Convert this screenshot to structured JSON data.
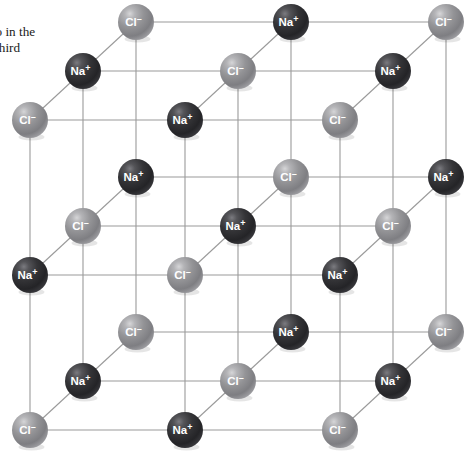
{
  "figure": {
    "caption_text": "wo in the\ne third\nhe",
    "background_color": "#ffffff"
  },
  "legend": {
    "sodium_label": "Na",
    "sodium_charge": "+",
    "chloride_label": "Cl",
    "chloride_charge": "–",
    "sodium_color": "#2f2f31",
    "sodium_highlight": "#6e6e72",
    "chloride_color": "#8d8d8f",
    "chloride_highlight": "#c9c9cb",
    "bond_color": "#9a9a9a",
    "grid_color": "#9a9a9a"
  },
  "lattice": {
    "type": "rock-salt",
    "dimensions": "3 x 3 x 3",
    "grid_spacing_x": 155,
    "grid_spacing_y": 155,
    "depth_offset_x": 53,
    "depth_offset_y": -49,
    "origin_x": 30,
    "origin_y": 430,
    "sphere_radius": 18,
    "ions": [
      {
        "i": 0,
        "j": 0,
        "k": 0,
        "x": 30,
        "y": 430,
        "species": "Cl",
        "charge": "–",
        "label": "Cl"
      },
      {
        "i": 1,
        "j": 0,
        "k": 0,
        "x": 185,
        "y": 430,
        "species": "Na",
        "charge": "+",
        "label": "Na"
      },
      {
        "i": 2,
        "j": 0,
        "k": 0,
        "x": 340,
        "y": 430,
        "species": "Cl",
        "charge": "–",
        "label": "Cl"
      },
      {
        "i": 0,
        "j": 1,
        "k": 0,
        "x": 30,
        "y": 275,
        "species": "Na",
        "charge": "+",
        "label": "Na"
      },
      {
        "i": 1,
        "j": 1,
        "k": 0,
        "x": 185,
        "y": 275,
        "species": "Cl",
        "charge": "–",
        "label": "Cl"
      },
      {
        "i": 2,
        "j": 1,
        "k": 0,
        "x": 340,
        "y": 275,
        "species": "Na",
        "charge": "+",
        "label": "Na"
      },
      {
        "i": 0,
        "j": 2,
        "k": 0,
        "x": 30,
        "y": 120,
        "species": "Cl",
        "charge": "–",
        "label": "Cl"
      },
      {
        "i": 1,
        "j": 2,
        "k": 0,
        "x": 185,
        "y": 120,
        "species": "Na",
        "charge": "+",
        "label": "Na"
      },
      {
        "i": 2,
        "j": 2,
        "k": 0,
        "x": 340,
        "y": 120,
        "species": "Cl",
        "charge": "–",
        "label": "Cl"
      },
      {
        "i": 0,
        "j": 0,
        "k": 1,
        "x": 83,
        "y": 381,
        "species": "Na",
        "charge": "+",
        "label": "Na"
      },
      {
        "i": 1,
        "j": 0,
        "k": 1,
        "x": 238,
        "y": 381,
        "species": "Cl",
        "charge": "–",
        "label": "Cl"
      },
      {
        "i": 2,
        "j": 0,
        "k": 1,
        "x": 393,
        "y": 381,
        "species": "Na",
        "charge": "+",
        "label": "Na"
      },
      {
        "i": 0,
        "j": 1,
        "k": 1,
        "x": 83,
        "y": 226,
        "species": "Cl",
        "charge": "–",
        "label": "Cl"
      },
      {
        "i": 1,
        "j": 1,
        "k": 1,
        "x": 238,
        "y": 226,
        "species": "Na",
        "charge": "+",
        "label": "Na"
      },
      {
        "i": 2,
        "j": 1,
        "k": 1,
        "x": 393,
        "y": 226,
        "species": "Cl",
        "charge": "–",
        "label": "Cl"
      },
      {
        "i": 0,
        "j": 2,
        "k": 1,
        "x": 83,
        "y": 71,
        "species": "Na",
        "charge": "+",
        "label": "Na"
      },
      {
        "i": 1,
        "j": 2,
        "k": 1,
        "x": 238,
        "y": 71,
        "species": "Cl",
        "charge": "–",
        "label": "Cl"
      },
      {
        "i": 2,
        "j": 2,
        "k": 1,
        "x": 393,
        "y": 71,
        "species": "Na",
        "charge": "+",
        "label": "Na"
      },
      {
        "i": 0,
        "j": 0,
        "k": 2,
        "x": 136,
        "y": 332,
        "species": "Cl",
        "charge": "–",
        "label": "Cl"
      },
      {
        "i": 1,
        "j": 0,
        "k": 2,
        "x": 291,
        "y": 332,
        "species": "Na",
        "charge": "+",
        "label": "Na"
      },
      {
        "i": 2,
        "j": 0,
        "k": 2,
        "x": 446,
        "y": 332,
        "species": "Cl",
        "charge": "–",
        "label": "Cl"
      },
      {
        "i": 0,
        "j": 1,
        "k": 2,
        "x": 136,
        "y": 177,
        "species": "Na",
        "charge": "+",
        "label": "Na"
      },
      {
        "i": 1,
        "j": 1,
        "k": 2,
        "x": 291,
        "y": 177,
        "species": "Cl",
        "charge": "–",
        "label": "Cl"
      },
      {
        "i": 2,
        "j": 1,
        "k": 2,
        "x": 446,
        "y": 177,
        "species": "Na",
        "charge": "+",
        "label": "Na"
      },
      {
        "i": 0,
        "j": 2,
        "k": 2,
        "x": 136,
        "y": 22,
        "species": "Cl",
        "charge": "–",
        "label": "Cl"
      },
      {
        "i": 1,
        "j": 2,
        "k": 2,
        "x": 291,
        "y": 22,
        "species": "Na",
        "charge": "+",
        "label": "Na"
      },
      {
        "i": 2,
        "j": 2,
        "k": 2,
        "x": 446,
        "y": 22,
        "species": "Cl",
        "charge": "–",
        "label": "Cl"
      }
    ]
  }
}
